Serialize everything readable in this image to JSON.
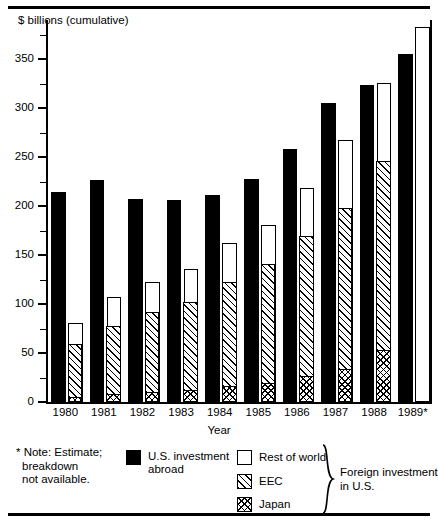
{
  "axis": {
    "y_title": "$ billions (cumulative)",
    "x_title": "Year",
    "y_ticks_major": [
      "0",
      "50",
      "100",
      "150",
      "200",
      "250",
      "300",
      "350"
    ]
  },
  "note": {
    "line1": "* Note: Estimate;",
    "line2": "breakdown",
    "line3": "not available."
  },
  "legend": {
    "us_label_line1": "U.S. investment",
    "us_label_line2": "abroad",
    "rest_label": "Rest of world",
    "eec_label": "EEC",
    "japan_label": "Japan",
    "bracket_line1": "Foreign investment",
    "bracket_line2": "in U.S."
  },
  "chart_data": {
    "type": "bar",
    "title": "",
    "xlabel": "Year",
    "ylabel": "$ billions (cumulative)",
    "ylim": [
      0,
      390
    ],
    "yticks": [
      0,
      50,
      100,
      150,
      200,
      250,
      300,
      350
    ],
    "yticks_minor_step": 25,
    "grid": false,
    "legend_position": "below-plot",
    "categories": [
      "1980",
      "1981",
      "1982",
      "1983",
      "1984",
      "1985",
      "1986",
      "1987",
      "1988",
      "1989*"
    ],
    "series": [
      {
        "name": "U.S. investment abroad",
        "fill": "solid-black",
        "values": [
          214,
          227,
          207,
          206,
          211,
          228,
          258,
          305,
          324,
          355
        ]
      },
      {
        "name": "Japan",
        "fill": "cross-hatch",
        "stack": "foreign-investment-in-us",
        "values": [
          5,
          8,
          10,
          12,
          16,
          19,
          26,
          33,
          52,
          null
        ]
      },
      {
        "name": "EEC",
        "fill": "diagonal-hatch",
        "stack": "foreign-investment-in-us",
        "values": [
          53,
          69,
          81,
          89,
          106,
          121,
          142,
          164,
          193,
          null
        ]
      },
      {
        "name": "Rest of world",
        "fill": "white",
        "stack": "foreign-investment-in-us",
        "values": [
          23,
          30,
          32,
          35,
          40,
          41,
          50,
          71,
          81,
          null
        ]
      }
    ],
    "stack_totals_foreign": [
      81,
      107,
      123,
      136,
      162,
      181,
      218,
      268,
      326,
      383
    ]
  }
}
